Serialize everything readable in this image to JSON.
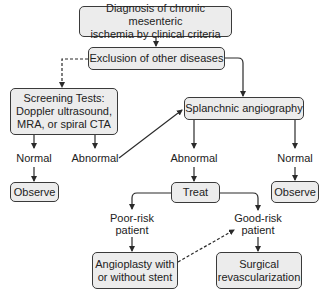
{
  "diagram": {
    "nodes": {
      "diagnosis": "Diagnosis of chronic mesenteric ischemia by clinical criteria",
      "diagnosis_line1": "Diagnosis of chronic mesenteric",
      "diagnosis_line2": "ischemia by clinical criteria",
      "exclusion": "Exclusion of other diseases",
      "screening_line1": "Screening Tests:",
      "screening_line2": "Doppler ultrasound,",
      "screening_line3": "MRA, or spiral CTA",
      "angiography": "Splanchnic angiography",
      "observe_left": "Observe",
      "treat": "Treat",
      "observe_right": "Observe",
      "angioplasty_line1": "Angioplasty with",
      "angioplasty_line2": "or without stent",
      "surgical_line1": "Surgical",
      "surgical_line2": "revascularization"
    },
    "labels": {
      "screen_normal": "Normal",
      "screen_abnormal": "Abnormal",
      "angio_abnormal": "Abnormal",
      "angio_normal": "Normal",
      "poor_risk_line1": "Poor-risk",
      "poor_risk_line2": "patient",
      "good_risk_line1": "Good-risk",
      "good_risk_line2": "patient"
    },
    "edges": [
      {
        "from": "diagnosis",
        "to": "exclusion",
        "style": "solid"
      },
      {
        "from": "exclusion",
        "to": "screening",
        "style": "dashed"
      },
      {
        "from": "exclusion",
        "to": "angiography",
        "style": "solid"
      },
      {
        "from": "screening",
        "to": "screen_normal",
        "style": "solid"
      },
      {
        "from": "screening",
        "to": "screen_abnormal",
        "style": "solid"
      },
      {
        "from": "screen_normal",
        "to": "observe_left",
        "style": "solid"
      },
      {
        "from": "screen_abnormal",
        "to": "angiography",
        "style": "solid"
      },
      {
        "from": "angiography",
        "to": "angio_abnormal",
        "style": "solid"
      },
      {
        "from": "angiography",
        "to": "angio_normal",
        "style": "solid"
      },
      {
        "from": "angio_abnormal",
        "to": "treat",
        "style": "solid"
      },
      {
        "from": "angio_normal",
        "to": "observe_right",
        "style": "solid"
      },
      {
        "from": "treat",
        "to": "poor_risk",
        "style": "solid"
      },
      {
        "from": "treat",
        "to": "good_risk",
        "style": "solid"
      },
      {
        "from": "poor_risk",
        "to": "angioplasty",
        "style": "solid"
      },
      {
        "from": "good_risk",
        "to": "surgical",
        "style": "solid"
      },
      {
        "from": "angioplasty",
        "to": "good_risk",
        "style": "dashed"
      }
    ],
    "colors": {
      "box_fill": "#ececec",
      "stroke": "#3a3a3a",
      "text": "#222222"
    }
  }
}
